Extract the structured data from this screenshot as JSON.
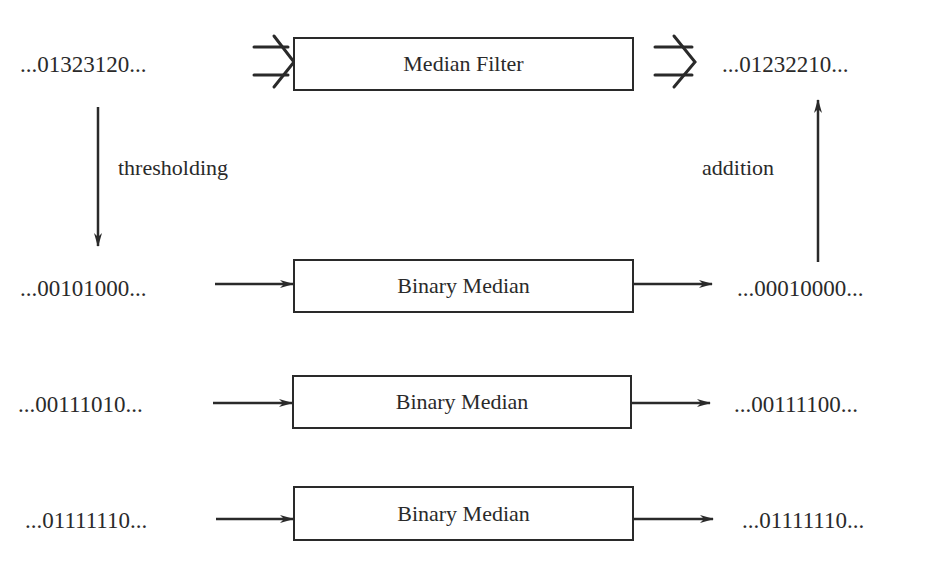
{
  "diagram": {
    "type": "block-diagram",
    "top_row": {
      "input": "...01323120...",
      "block": "Median Filter",
      "output": "...01232210..."
    },
    "edge_labels": {
      "left_down": "thresholding",
      "right_up": "addition"
    },
    "binary_rows": [
      {
        "input": "...00101000...",
        "block": "Binary Median",
        "output": "...00010000..."
      },
      {
        "input": "...00111010...",
        "block": "Binary Median",
        "output": "...00111100..."
      },
      {
        "input": "...01111110...",
        "block": "Binary Median",
        "output": "...01111110..."
      }
    ],
    "colors": {
      "ink": "#2a2a2a",
      "background": "#ffffff"
    }
  }
}
